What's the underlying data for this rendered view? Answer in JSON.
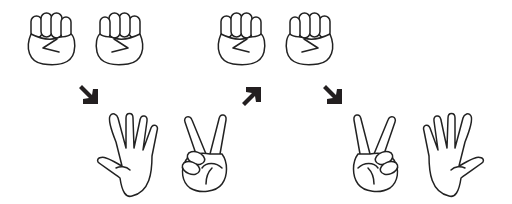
{
  "illustration": {
    "subject": "rock-paper-scissors hand gestures sequence",
    "colors": {
      "line": "#222222",
      "arrow": "#231f20",
      "background": "#ffffff"
    },
    "groups": [
      {
        "hands": [
          "fist",
          "fist"
        ],
        "arrow": "down-right",
        "result": [
          "open-hand",
          "v-sign"
        ]
      },
      {
        "hands": [
          "fist",
          "fist"
        ],
        "arrow_left": "up-right",
        "arrow_right": "down-right",
        "result": [
          "v-sign",
          "open-hand"
        ]
      }
    ]
  }
}
